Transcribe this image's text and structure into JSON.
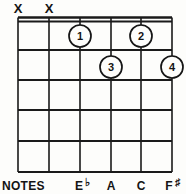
{
  "diagram": {
    "type": "guitar-chord-diagram",
    "title": "",
    "strings_count": 6,
    "frets_count": 5,
    "nut_shown": true,
    "colors": {
      "ink": "#151515",
      "paper": "#fdfdfb"
    },
    "string_x": [
      18,
      49,
      80,
      111,
      141,
      172
    ],
    "fret_y": [
      20,
      50,
      80,
      110,
      141,
      172
    ],
    "mutes": [
      {
        "label": "X",
        "string": 1,
        "x": 18,
        "y": 12
      },
      {
        "label": "X",
        "string": 2,
        "x": 49,
        "y": 12
      }
    ],
    "fingers": [
      {
        "label": "1",
        "string": 3,
        "fret": 1,
        "cx": 80,
        "cy": 36,
        "r": 11
      },
      {
        "label": "2",
        "string": 5,
        "fret": 1,
        "cx": 141,
        "cy": 36,
        "r": 11
      },
      {
        "label": "3",
        "string": 4,
        "fret": 2,
        "cx": 111,
        "cy": 67,
        "r": 11
      },
      {
        "label": "4",
        "string": 6,
        "fret": 2,
        "cx": 172,
        "cy": 67,
        "r": 11
      }
    ],
    "notes_row": {
      "row_label": "NOTES",
      "row_label_x": 2,
      "row_label_y": 189,
      "notes": [
        {
          "letter": "E",
          "accidental": "♭",
          "full": "E♭",
          "string": 3,
          "x": 80,
          "y": 189
        },
        {
          "letter": "A",
          "accidental": "",
          "full": "A",
          "string": 4,
          "x": 111,
          "y": 189
        },
        {
          "letter": "C",
          "accidental": "",
          "full": "C",
          "string": 5,
          "x": 141,
          "y": 189
        },
        {
          "letter": "F",
          "accidental": "♯",
          "full": "F♯",
          "string": 6,
          "x": 170,
          "y": 189
        }
      ]
    }
  }
}
